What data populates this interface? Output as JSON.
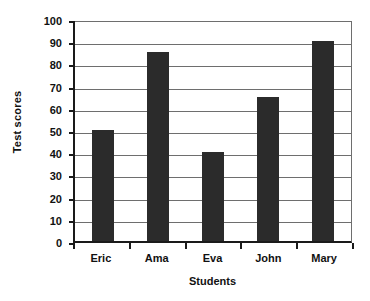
{
  "chart_data": {
    "type": "bar",
    "title": "",
    "categories": [
      "Eric",
      "Ama",
      "Eva",
      "John",
      "Mary"
    ],
    "values": [
      50,
      85,
      40,
      65,
      90
    ],
    "xlabel": "Students",
    "ylabel": "Test scores",
    "ylim": [
      0,
      100
    ],
    "ytick_step": 10,
    "yticks": [
      0,
      10,
      20,
      30,
      40,
      50,
      60,
      70,
      80,
      90,
      100
    ],
    "ytick_labels": [
      "0",
      "10",
      "20",
      "30",
      "40",
      "50",
      "60",
      "70",
      "80",
      "90",
      "100"
    ],
    "grid": true,
    "grid_axis": "y",
    "legend": false,
    "legend_position": "none",
    "bar_color": "#2b2b2b",
    "grid_color": "#6e6e6e",
    "axis_color": "#1a1a1a",
    "background_color": "#ffffff"
  }
}
